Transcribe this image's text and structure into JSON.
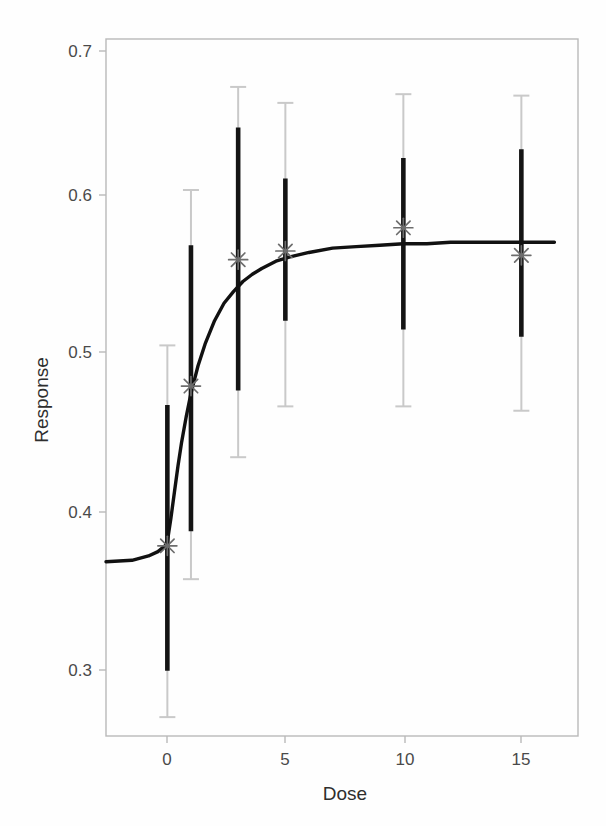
{
  "figure": {
    "title": "",
    "background_color": "#ffffff"
  },
  "axes": {
    "x_title": "Dose",
    "y_title": "Response",
    "x_ticks": [
      "0",
      "5",
      "10",
      "15"
    ],
    "y_ticks": [
      "0.3",
      "0.4",
      "0.5",
      "0.6",
      "0.7"
    ],
    "frame_color": "#b9b9b9"
  },
  "colors": {
    "curve": "#111111",
    "inner_interval": "#141414",
    "outer_interval": "#c9c9c9",
    "marker": "#6d6d6d",
    "tick_label": "#4a4a4a",
    "axis_title": "#2e2e2e"
  },
  "chart_data": {
    "type": "scatter",
    "title": "",
    "xlabel": "Dose",
    "ylabel": "Response",
    "xlim": [
      -2.6,
      17.4
    ],
    "ylim": [
      0.232,
      0.712
    ],
    "xticks": [
      0,
      5,
      10,
      15
    ],
    "yticks": [
      0.3,
      0.4,
      0.5,
      0.6,
      0.7
    ],
    "grid": false,
    "legend": null,
    "x": [
      0,
      1,
      3,
      5,
      10,
      15
    ],
    "y": [
      0.363,
      0.473,
      0.56,
      0.566,
      0.582,
      0.563
    ],
    "series": [
      {
        "name": "Observed response (marker)",
        "marker": "asterisk",
        "values": [
          0.363,
          0.473,
          0.56,
          0.566,
          0.582,
          0.563
        ]
      },
      {
        "name": "Inner interval (thick black)",
        "lower": [
          0.277,
          0.373,
          0.47,
          0.518,
          0.512,
          0.507
        ],
        "upper": [
          0.46,
          0.57,
          0.651,
          0.616,
          0.63,
          0.636
        ]
      },
      {
        "name": "Outer interval (thin grey, capped)",
        "lower": [
          0.245,
          0.34,
          0.424,
          0.459,
          0.459,
          0.456
        ],
        "upper": [
          0.501,
          0.608,
          0.679,
          0.668,
          0.674,
          0.673
        ]
      },
      {
        "name": "Fitted Emax curve",
        "type": "line",
        "x": [
          -2.6,
          -1.5,
          -0.8,
          -0.4,
          -0.1,
          0.0,
          0.15,
          0.3,
          0.45,
          0.6,
          0.8,
          1.0,
          1.3,
          1.6,
          2.0,
          2.4,
          2.8,
          3.2,
          3.6,
          4.0,
          4.6,
          5.2,
          6.0,
          7.0,
          8.0,
          9.0,
          10.0,
          11.0,
          12.0,
          13.5,
          15.0,
          16.4
        ],
        "y": [
          0.352,
          0.353,
          0.356,
          0.359,
          0.363,
          0.366,
          0.382,
          0.4,
          0.418,
          0.434,
          0.452,
          0.468,
          0.487,
          0.502,
          0.518,
          0.53,
          0.538,
          0.545,
          0.55,
          0.554,
          0.559,
          0.562,
          0.565,
          0.568,
          0.569,
          0.57,
          0.571,
          0.571,
          0.572,
          0.572,
          0.572,
          0.572
        ]
      }
    ]
  }
}
